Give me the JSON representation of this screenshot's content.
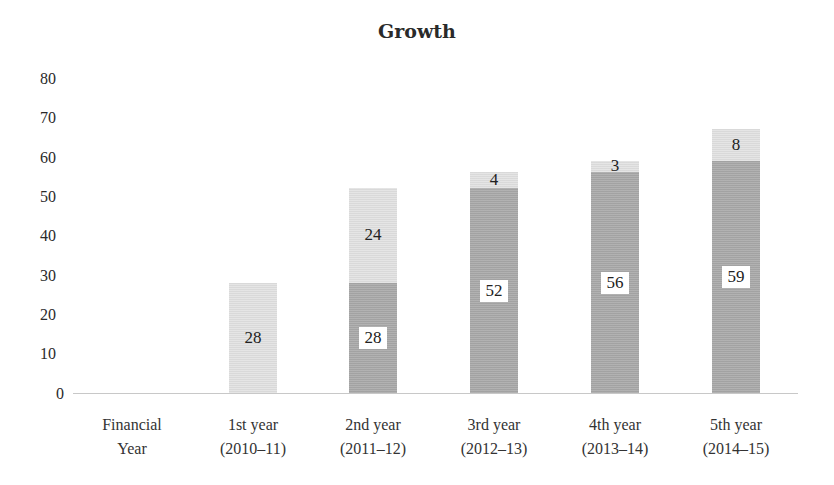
{
  "chart_data": {
    "type": "bar",
    "stacked": true,
    "title": "Growth",
    "xlabel": "",
    "ylabel": "",
    "ylim": [
      0,
      80
    ],
    "yticks": [
      0,
      10,
      20,
      30,
      40,
      50,
      60,
      70,
      80
    ],
    "grid": false,
    "legend": null,
    "categories": [
      "Financial Year",
      "1st year (2010–11)",
      "2nd year (2011–12)",
      "3rd year (2012–13)",
      "4th year (2013–14)",
      "5th year (2014–15)"
    ],
    "category_lines": [
      [
        "Financial",
        "Year"
      ],
      [
        "1st year",
        "(2010–11)"
      ],
      [
        "2nd year",
        "(2011–12)"
      ],
      [
        "3rd year",
        "(2012–13)"
      ],
      [
        "4th year",
        "(2013–14)"
      ],
      [
        "5th year",
        "(2014–15)"
      ]
    ],
    "series": [
      {
        "name": "Base (previous total)",
        "color": "#a9a9a9",
        "values": [
          null,
          0,
          28,
          52,
          56,
          59
        ]
      },
      {
        "name": "Growth (increment)",
        "color": "#e2e2e2",
        "values": [
          null,
          28,
          24,
          4,
          3,
          8
        ]
      }
    ],
    "labels": {
      "base": [
        "",
        "",
        "28",
        "52",
        "56",
        "59"
      ],
      "growth": [
        "",
        "28",
        "24",
        "4",
        "3",
        "8"
      ]
    }
  }
}
